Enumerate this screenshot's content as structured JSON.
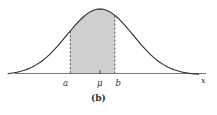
{
  "figure": {
    "caption": "(b)"
  },
  "chart_data": {
    "type": "area",
    "title": "",
    "subtitle": "",
    "xlabel": "x",
    "ylabel": "",
    "grid": false,
    "distribution": "normal",
    "mean_label": "μ",
    "shaded_interval": {
      "lower_label": "a",
      "upper_label": "b",
      "lower_z": -0.9,
      "upper_z": 0.45
    },
    "x_tick_labels": [
      "a",
      "μ",
      "b",
      "x"
    ],
    "curve_z_range": [
      -2.8,
      3.0
    ],
    "colors": {
      "curve": "#2b2b2b",
      "shade": "#cfcfcf",
      "axis": "#555555",
      "dashed": "#555555"
    }
  },
  "labels": {
    "a": "a",
    "mu": "μ",
    "b": "b",
    "x": "x",
    "caption": "(b)"
  }
}
